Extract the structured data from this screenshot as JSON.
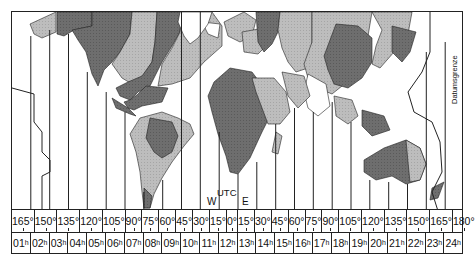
{
  "diagram": {
    "map": {
      "labels": {
        "west": "W",
        "utc": "UTC",
        "east": "E",
        "dateline": "Datumsgrenze"
      },
      "fill_colors": {
        "dark": "#6e6e6e",
        "light": "#b8b8b8",
        "white": "#ffffff",
        "line": "#222222"
      },
      "zone_count": 24
    },
    "degrees": [
      "165°",
      "150°",
      "135°",
      "120°",
      "105°",
      "90°",
      "75°",
      "60°",
      "45°",
      "30°",
      "15°",
      "0°",
      "15°",
      "30°",
      "45°",
      "60°",
      "75°",
      "90°",
      "105°",
      "120°",
      "135°",
      "150°",
      "165°",
      "180°"
    ],
    "hours": [
      {
        "h": "01",
        "s": "h"
      },
      {
        "h": "02",
        "s": "h"
      },
      {
        "h": "03",
        "s": "h"
      },
      {
        "h": "04",
        "s": "h"
      },
      {
        "h": "05",
        "s": "h"
      },
      {
        "h": "06",
        "s": "h"
      },
      {
        "h": "07",
        "s": "h"
      },
      {
        "h": "08",
        "s": "h"
      },
      {
        "h": "09",
        "s": "h"
      },
      {
        "h": "10",
        "s": "h"
      },
      {
        "h": "11",
        "s": "h"
      },
      {
        "h": "12",
        "s": "h"
      },
      {
        "h": "13",
        "s": "h"
      },
      {
        "h": "14",
        "s": "h"
      },
      {
        "h": "15",
        "s": "h"
      },
      {
        "h": "16",
        "s": "h"
      },
      {
        "h": "17",
        "s": "h"
      },
      {
        "h": "18",
        "s": "h"
      },
      {
        "h": "19",
        "s": "h"
      },
      {
        "h": "20",
        "s": "h"
      },
      {
        "h": "21",
        "s": "h"
      },
      {
        "h": "22",
        "s": "h"
      },
      {
        "h": "23",
        "s": "h"
      },
      {
        "h": "24",
        "s": "h"
      }
    ]
  }
}
